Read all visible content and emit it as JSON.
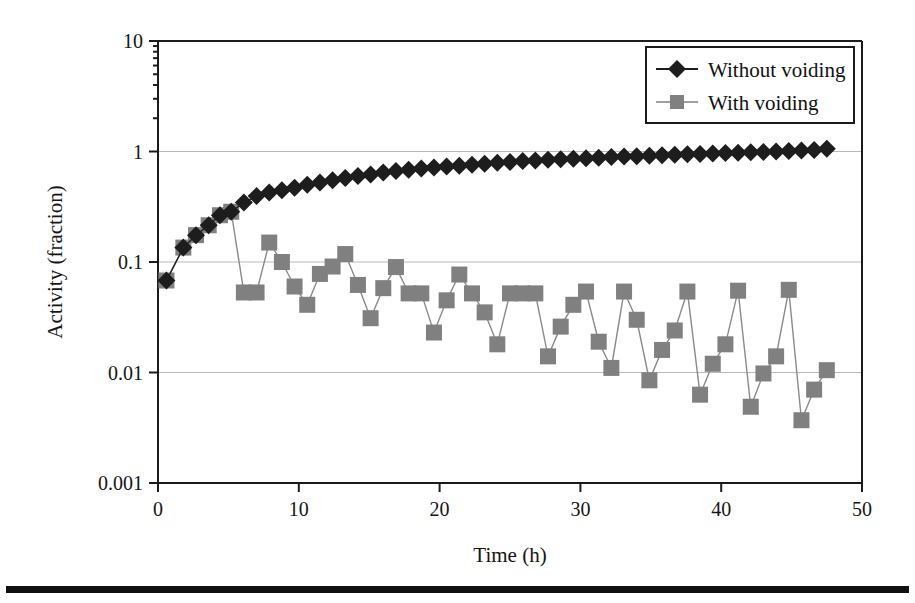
{
  "figure": {
    "background": "#ffffff",
    "plot_area": {
      "left": 158,
      "right": 862,
      "top": 41,
      "bottom": 483
    },
    "page_rule": {
      "present": true,
      "color": "#111111"
    }
  },
  "axes": {
    "x": {
      "title": "Time (h)",
      "ticks": [
        "0",
        "10",
        "20",
        "30",
        "40",
        "50"
      ],
      "min": 0,
      "max": 50
    },
    "y": {
      "title": "Activity (fraction)",
      "ticks": [
        "10",
        "1",
        "0.1",
        "0.01",
        "0.001"
      ],
      "min": 0.001,
      "max": 10,
      "scale": "log"
    }
  },
  "legend": {
    "position": "top-right",
    "entries": [
      {
        "label": "Without voiding",
        "marker": "diamond",
        "color": "#1d1d1d"
      },
      {
        "label": "With voiding",
        "marker": "square",
        "color": "#808080"
      }
    ]
  },
  "chart_data": {
    "type": "line",
    "title": "",
    "xlabel": "Time (h)",
    "ylabel": "Activity (fraction)",
    "xlim": [
      0,
      50
    ],
    "ylim": [
      0.001,
      10
    ],
    "yscale": "log",
    "grid": "horizontal",
    "legend_position": "top-right",
    "series": [
      {
        "name": "Without voiding",
        "marker": "diamond",
        "color": "#1d1d1d",
        "x": [
          0.6,
          1.8,
          2.7,
          3.6,
          4.4,
          5.2,
          6.1,
          7.0,
          7.9,
          8.8,
          9.7,
          10.6,
          11.5,
          12.4,
          13.3,
          14.2,
          15.1,
          16.0,
          16.9,
          17.8,
          18.7,
          19.6,
          20.5,
          21.4,
          22.3,
          23.2,
          24.1,
          25.0,
          25.9,
          26.8,
          27.7,
          28.6,
          29.5,
          30.4,
          31.3,
          32.2,
          33.1,
          34.0,
          34.9,
          35.8,
          36.7,
          37.6,
          38.5,
          39.4,
          40.3,
          41.2,
          42.1,
          43.0,
          43.9,
          44.8,
          45.7,
          46.6,
          47.5
        ],
        "y": [
          0.068,
          0.135,
          0.175,
          0.215,
          0.265,
          0.285,
          0.345,
          0.395,
          0.425,
          0.445,
          0.47,
          0.5,
          0.525,
          0.55,
          0.575,
          0.6,
          0.62,
          0.645,
          0.665,
          0.685,
          0.7,
          0.715,
          0.73,
          0.745,
          0.76,
          0.775,
          0.79,
          0.805,
          0.82,
          0.83,
          0.84,
          0.85,
          0.86,
          0.87,
          0.88,
          0.89,
          0.9,
          0.905,
          0.915,
          0.925,
          0.935,
          0.945,
          0.95,
          0.96,
          0.97,
          0.975,
          0.985,
          0.99,
          1.0,
          1.01,
          1.02,
          1.03,
          1.06
        ]
      },
      {
        "name": "With voiding",
        "marker": "square",
        "color": "#808080",
        "x": [
          0.6,
          1.8,
          2.7,
          3.6,
          4.4,
          5.2,
          6.1,
          7.0,
          7.9,
          8.8,
          9.7,
          10.6,
          11.5,
          12.4,
          13.3,
          14.2,
          15.1,
          16.0,
          16.9,
          17.8,
          18.7,
          19.6,
          20.5,
          21.4,
          22.3,
          23.2,
          24.1,
          25.0,
          25.9,
          26.8,
          27.7,
          28.6,
          29.5,
          30.4,
          31.3,
          32.2,
          33.1,
          34.0,
          34.9,
          35.8,
          36.7,
          37.6,
          38.5,
          39.4,
          40.3,
          41.2,
          42.1,
          43.0,
          43.9,
          44.8,
          45.7,
          46.6,
          47.5
        ],
        "y": [
          0.068,
          0.135,
          0.175,
          0.215,
          0.265,
          0.285,
          0.053,
          0.053,
          0.15,
          0.1,
          0.06,
          0.041,
          0.078,
          0.091,
          0.118,
          0.062,
          0.031,
          0.058,
          0.09,
          0.052,
          0.052,
          0.023,
          0.045,
          0.077,
          0.052,
          0.035,
          0.018,
          0.052,
          0.052,
          0.052,
          0.014,
          0.026,
          0.041,
          0.054,
          0.019,
          0.011,
          0.054,
          0.03,
          0.0085,
          0.016,
          0.024,
          0.054,
          0.0063,
          0.012,
          0.018,
          0.055,
          0.0049,
          0.0098,
          0.014,
          0.056,
          0.0037,
          0.007,
          0.0105
        ]
      }
    ]
  }
}
